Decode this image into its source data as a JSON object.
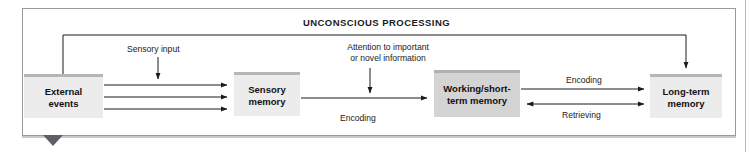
{
  "diagram": {
    "heading": "UNCONSCIOUS PROCESSING",
    "boxes": [
      {
        "id": "external",
        "label": "External\nevents",
        "line1": "External",
        "line2": "events"
      },
      {
        "id": "sensory",
        "label": "Sensory\nmemory",
        "line1": "Sensory",
        "line2": "memory"
      },
      {
        "id": "working",
        "label": "Working/short-\nterm memory",
        "line1": "Working/short-",
        "line2": "term memory"
      },
      {
        "id": "longterm",
        "label": "Long-term\nmemory",
        "line1": "Long-term",
        "line2": "memory"
      }
    ],
    "annotations": {
      "sensory_input": "Sensory input",
      "attention_line1": "Attention to important",
      "attention_line2": "or novel information",
      "encoding_middle": "Encoding",
      "encoding_right": "Encoding",
      "retrieving": "Retrieving"
    },
    "colors": {
      "box_fill_light": "#ececec",
      "box_fill_dark": "#d4d4d4",
      "box_top_bar": "#b6b6b6",
      "frame": "#9a9a9a",
      "arrow": "#1b1b1b",
      "tab": "#5d6166",
      "text": "#111111"
    }
  }
}
